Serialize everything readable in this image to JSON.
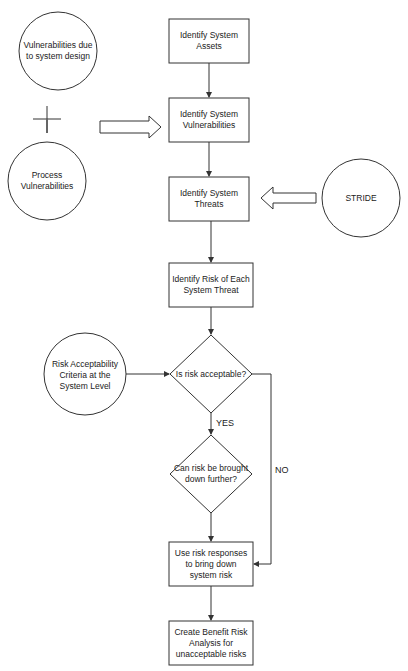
{
  "diagram": {
    "colors": {
      "stroke": "#333333",
      "fill": "#ffffff",
      "text": "#222222",
      "background": "#ffffff"
    },
    "nodes": {
      "vuln_design": {
        "type": "circle",
        "label": "Vulnerabilities due to system design"
      },
      "plus": {
        "type": "symbol",
        "label": "+"
      },
      "process_vuln": {
        "type": "circle",
        "label": "Process Vulnerabilities"
      },
      "identify_assets": {
        "type": "process",
        "label": "Identify System Assets"
      },
      "identify_vulns": {
        "type": "process",
        "label": "Identify System Vulnerabilities"
      },
      "identify_threats": {
        "type": "process",
        "label": "Identify System Threats"
      },
      "stride": {
        "type": "circle",
        "label": "STRIDE"
      },
      "identify_risk": {
        "type": "process",
        "label": "Identify Risk of Each System Threat"
      },
      "criteria": {
        "type": "circle",
        "label": "Risk Acceptability Criteria at the System Level"
      },
      "is_acceptable": {
        "type": "decision",
        "label": "Is risk acceptable?"
      },
      "can_reduce": {
        "type": "decision",
        "label": "Can risk be brought down further?"
      },
      "use_responses": {
        "type": "process",
        "label": "Use risk responses to bring down system risk"
      },
      "benefit_risk": {
        "type": "process",
        "label": "Create Benefit Risk Analysis for unacceptable risks"
      }
    },
    "edges": {
      "yes": {
        "from": "is_acceptable",
        "to": "can_reduce",
        "label": "YES"
      },
      "no": {
        "from": "is_acceptable",
        "to": "use_responses",
        "label": "NO"
      }
    }
  }
}
